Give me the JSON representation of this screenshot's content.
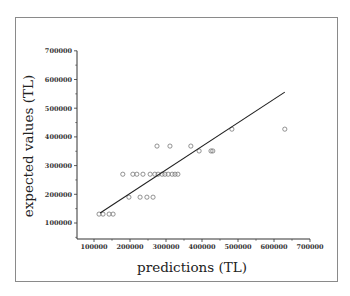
{
  "chart_data": {
    "type": "scatter",
    "title": "",
    "xlabel": "predictions (TL)",
    "ylabel": "expected values (TL)",
    "xlim": [
      52000,
      700000
    ],
    "ylim": [
      50000,
      700000
    ],
    "xticks": [
      "100000",
      "200000",
      "300000",
      "400000",
      "500000",
      "600000",
      "700000"
    ],
    "yticks": [
      "100000",
      "200000",
      "300000",
      "400000",
      "500000",
      "600000",
      "700000"
    ],
    "grid": false,
    "legend": null,
    "series": [
      {
        "name": "observations",
        "marker": "open-circle",
        "points": [
          [
            114000,
            131000
          ],
          [
            125000,
            131000
          ],
          [
            142000,
            131000
          ],
          [
            153000,
            131000
          ],
          [
            197000,
            190000
          ],
          [
            228000,
            190000
          ],
          [
            247000,
            190000
          ],
          [
            264000,
            190000
          ],
          [
            180000,
            270000
          ],
          [
            208000,
            270000
          ],
          [
            219000,
            270000
          ],
          [
            236000,
            270000
          ],
          [
            256000,
            270000
          ],
          [
            269000,
            270000
          ],
          [
            278000,
            270000
          ],
          [
            289000,
            270000
          ],
          [
            297000,
            270000
          ],
          [
            306000,
            270000
          ],
          [
            317000,
            270000
          ],
          [
            325000,
            270000
          ],
          [
            333000,
            270000
          ],
          [
            275000,
            368000
          ],
          [
            311000,
            368000
          ],
          [
            369000,
            368000
          ],
          [
            392000,
            351000
          ],
          [
            425000,
            351000
          ],
          [
            430000,
            351000
          ],
          [
            483000,
            427000
          ],
          [
            630000,
            427000
          ]
        ]
      },
      {
        "name": "fit line",
        "type": "line",
        "points": [
          [
            117000,
            135000
          ],
          [
            630000,
            556000
          ]
        ]
      }
    ]
  }
}
